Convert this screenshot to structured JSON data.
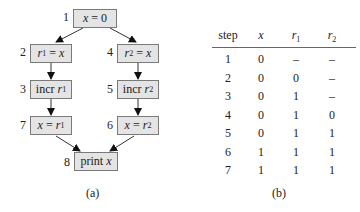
{
  "diagram": {
    "nodes": [
      {
        "id": 1,
        "num": "1",
        "pre": "x",
        "op": " = ",
        "var": "0",
        "sub": ""
      },
      {
        "id": 2,
        "num": "2",
        "pre": "r",
        "sub": "1",
        "op": " = ",
        "var": "x"
      },
      {
        "id": 3,
        "num": "3",
        "pre": "incr ",
        "var": "r",
        "sub": "1"
      },
      {
        "id": 4,
        "num": "4",
        "pre": "r",
        "sub": "2",
        "op": " = ",
        "var": "x"
      },
      {
        "id": 5,
        "num": "5",
        "pre": "incr ",
        "var": "r",
        "sub": "2"
      },
      {
        "id": 6,
        "num": "6",
        "pre": "x",
        "op": " = ",
        "var": "r",
        "sub": "2"
      },
      {
        "id": 7,
        "num": "7",
        "pre": "x",
        "op": " = ",
        "var": "r",
        "sub": "1"
      },
      {
        "id": 8,
        "num": "8",
        "pre": "print ",
        "var": "x"
      }
    ],
    "edges": [
      [
        1,
        2
      ],
      [
        1,
        4
      ],
      [
        2,
        3
      ],
      [
        4,
        5
      ],
      [
        3,
        7
      ],
      [
        5,
        6
      ],
      [
        7,
        8
      ],
      [
        6,
        8
      ]
    ],
    "caption": "(a)"
  },
  "table": {
    "headers": {
      "step": "step",
      "x": "x",
      "r1_base": "r",
      "r1_sub": "1",
      "r2_base": "r",
      "r2_sub": "2"
    },
    "rows": [
      [
        "1",
        "0",
        "–",
        "–"
      ],
      [
        "2",
        "0",
        "0",
        "–"
      ],
      [
        "3",
        "0",
        "1",
        "–"
      ],
      [
        "4",
        "0",
        "1",
        "0"
      ],
      [
        "5",
        "0",
        "1",
        "1"
      ],
      [
        "6",
        "1",
        "1",
        "1"
      ],
      [
        "7",
        "1",
        "1",
        "1"
      ]
    ],
    "caption": "(b)"
  }
}
